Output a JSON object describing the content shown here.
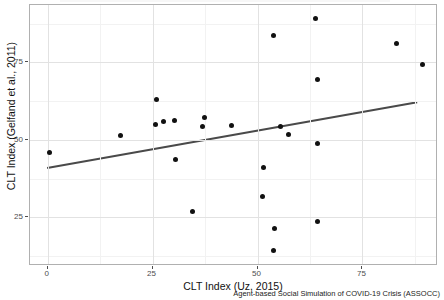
{
  "chart_data": {
    "type": "scatter",
    "title": "",
    "xlabel": "CLT Index (Uz, 2015)",
    "ylabel": "CLT Index (Gelfand et al., 2011)",
    "caption": "Agent-based Social Simulation of COVID-19 Crisis (ASSOCC)",
    "xlim": [
      -4.2,
      93.0
    ],
    "ylim": [
      9.3,
      93.5
    ],
    "xticks": [
      0,
      25,
      50,
      75
    ],
    "xtick_labels": [
      "0",
      "25",
      "50",
      "75"
    ],
    "yticks": [
      25,
      50,
      75
    ],
    "ytick_labels": [
      "25",
      "50",
      "75"
    ],
    "grid": true,
    "point_color": "#111111",
    "trendline_color": "#4a4a4a",
    "panel_border_color": "#b0b0b0",
    "grid_color": "#e2e2e2",
    "points": [
      {
        "x": 0.4,
        "y": 45.8
      },
      {
        "x": 17.4,
        "y": 51.5
      },
      {
        "x": 25.6,
        "y": 55.0
      },
      {
        "x": 26.0,
        "y": 62.9
      },
      {
        "x": 27.6,
        "y": 55.8
      },
      {
        "x": 30.2,
        "y": 56.4
      },
      {
        "x": 30.4,
        "y": 43.7
      },
      {
        "x": 34.6,
        "y": 26.9
      },
      {
        "x": 37.0,
        "y": 54.3
      },
      {
        "x": 37.4,
        "y": 57.2
      },
      {
        "x": 43.7,
        "y": 54.5
      },
      {
        "x": 51.5,
        "y": 41.2
      },
      {
        "x": 51.3,
        "y": 31.7
      },
      {
        "x": 53.8,
        "y": 14.4
      },
      {
        "x": 53.8,
        "y": 83.5
      },
      {
        "x": 54.0,
        "y": 21.5
      },
      {
        "x": 55.4,
        "y": 54.2
      },
      {
        "x": 57.3,
        "y": 51.6
      },
      {
        "x": 63.7,
        "y": 89.2
      },
      {
        "x": 64.2,
        "y": 69.6
      },
      {
        "x": 64.3,
        "y": 48.7
      },
      {
        "x": 64.3,
        "y": 23.5
      },
      {
        "x": 83.1,
        "y": 81.1
      },
      {
        "x": 89.3,
        "y": 74.4
      }
    ],
    "trendline": {
      "x_start": -0.1,
      "y_start": 40.5,
      "x_end": 88.5,
      "y_end": 61.9
    }
  }
}
